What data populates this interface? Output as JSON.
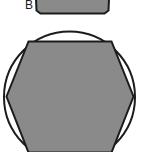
{
  "figure": {
    "title": "",
    "background_color": "#ffffff",
    "panels": [
      {
        "id": "panel-b",
        "label": "B",
        "label_position": {
          "x": 25,
          "y": -1
        },
        "description": "partially cropped polygon at top of image",
        "shape": {
          "kind": "polygon-clipped",
          "fill_color": "#8a8a8a",
          "stroke_color": "#1c1c1c",
          "stroke_width": 2,
          "points": "35.5,-12 109.5,-12 108.5,10.5 104.5,13.5 40.5,13.5 36.5,10.5"
        }
      },
      {
        "id": "panel-main",
        "label": "",
        "description": "circle with inscribed regular hexagon, cropped at bottom",
        "circle": {
          "kind": "circle",
          "fill_color": "#ffffff",
          "stroke_color": "#1c1c1c",
          "stroke_width": 2,
          "cx": 69.5,
          "cy": 97,
          "r": 65.5
        },
        "hexagon": {
          "kind": "polygon",
          "fill_color": "#8a8a8a",
          "stroke_color": "#1c1c1c",
          "stroke_width": 2,
          "points": "6.5,96.5 28.5,41.5 111.5,41.5 133.5,96.5 111.5,152.5 28.5,152.5"
        }
      }
    ]
  },
  "colors": {
    "shape_fill": "#8a8a8a",
    "outline": "#1c1c1c",
    "background": "#ffffff",
    "label_text": "#1a1a1a"
  }
}
